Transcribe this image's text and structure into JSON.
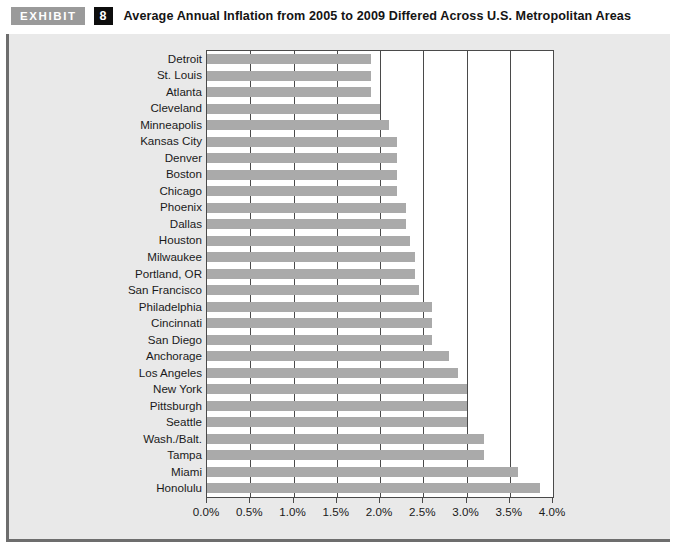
{
  "header": {
    "badge_label": "EXHIBIT",
    "exhibit_number": "8",
    "title": "Average Annual Inflation from 2005 to 2009 Differed Across U.S. Metropolitan Areas"
  },
  "colors": {
    "bar": "#aaaaaa",
    "badge_bg": "#9a9a9a",
    "number_bg": "#0d0d0d",
    "figure_bg": "#e9e9e9",
    "plot_bg": "#ffffff",
    "axis": "#4a4a4a",
    "frame_border": "#6d6d6d"
  },
  "chart_data": {
    "type": "bar",
    "orientation": "horizontal",
    "title": "Average Annual Inflation from 2005 to 2009 Differed Across U.S. Metropolitan Areas",
    "xlabel": "",
    "ylabel": "",
    "xlim": [
      0.0,
      4.0
    ],
    "xticks": [
      0.0,
      0.5,
      1.0,
      1.5,
      2.0,
      2.5,
      3.0,
      3.5,
      4.0
    ],
    "xtick_labels": [
      "0.0%",
      "0.5%",
      "1.0%",
      "1.5%",
      "2.0%",
      "2.5%",
      "3.0%",
      "3.5%",
      "4.0%"
    ],
    "grid": true,
    "legend": null,
    "categories": [
      "Detroit",
      "St. Louis",
      "Atlanta",
      "Cleveland",
      "Minneapolis",
      "Kansas City",
      "Denver",
      "Boston",
      "Chicago",
      "Phoenix",
      "Dallas",
      "Houston",
      "Milwaukee",
      "Portland, OR",
      "San Francisco",
      "Philadelphia",
      "Cincinnati",
      "San Diego",
      "Anchorage",
      "Los Angeles",
      "New York",
      "Pittsburgh",
      "Seattle",
      "Wash./Balt.",
      "Tampa",
      "Miami",
      "Honolulu"
    ],
    "values": [
      1.9,
      1.9,
      1.9,
      2.0,
      2.1,
      2.2,
      2.2,
      2.2,
      2.2,
      2.3,
      2.3,
      2.35,
      2.4,
      2.4,
      2.45,
      2.6,
      2.6,
      2.6,
      2.8,
      2.9,
      3.0,
      3.0,
      3.0,
      3.2,
      3.2,
      3.6,
      3.85
    ]
  }
}
